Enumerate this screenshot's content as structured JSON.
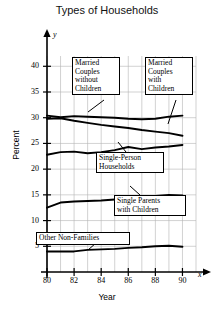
{
  "chart_data": {
    "type": "line",
    "title": "Types of Households",
    "xlabel": "Year",
    "ylabel": "Percent",
    "x_axis_variable": "x",
    "y_axis_variable": "y",
    "x": [
      80,
      81,
      82,
      83,
      84,
      85,
      86,
      87,
      88,
      89,
      90
    ],
    "xticks": [
      80,
      82,
      84,
      86,
      88,
      90
    ],
    "yticks": [
      5,
      10,
      15,
      20,
      25,
      30,
      35,
      40
    ],
    "xlim": [
      80,
      91
    ],
    "ylim": [
      0,
      42
    ],
    "grid": true,
    "legend": "annotated-callouts",
    "series": [
      {
        "name": "Married Couples without Children",
        "values": [
          30.4,
          30.1,
          30.3,
          30.2,
          30.1,
          30.0,
          29.8,
          29.7,
          29.8,
          30.2,
          30.4
        ]
      },
      {
        "name": "Married Couples with Children",
        "values": [
          29.8,
          29.9,
          29.4,
          29.0,
          28.6,
          28.3,
          28.0,
          27.6,
          27.3,
          27.0,
          26.5
        ]
      },
      {
        "name": "Single-Person Households",
        "values": [
          22.8,
          23.3,
          23.4,
          23.1,
          23.3,
          23.7,
          24.3,
          23.9,
          24.2,
          24.4,
          24.7
        ]
      },
      {
        "name": "Single Parents with Children",
        "values": [
          12.5,
          13.5,
          13.7,
          13.8,
          13.9,
          14.1,
          14.3,
          14.5,
          14.8,
          15.0,
          14.9
        ]
      },
      {
        "name": "Other Non-Families",
        "values": [
          4.0,
          4.0,
          4.0,
          4.3,
          4.4,
          4.5,
          4.7,
          4.8,
          5.0,
          5.1,
          4.9
        ]
      }
    ],
    "annotations": [
      {
        "text": "Married\nCouples\nwithout\nChildren",
        "target_series": "Married Couples without Children"
      },
      {
        "text": "Married\nCouples\nwith\nChildren",
        "target_series": "Married Couples with Children"
      },
      {
        "text": "Single-Person\nHouseholds",
        "target_series": "Single-Person Households"
      },
      {
        "text": "Single Parents\nwith Children",
        "target_series": "Single Parents with Children"
      },
      {
        "text": "Other Non-Families",
        "target_series": "Other Non-Families"
      }
    ],
    "colors": {
      "line": "#000000",
      "grid": "#b4b4b4",
      "axis": "#000000",
      "background": "#ffffff"
    }
  }
}
